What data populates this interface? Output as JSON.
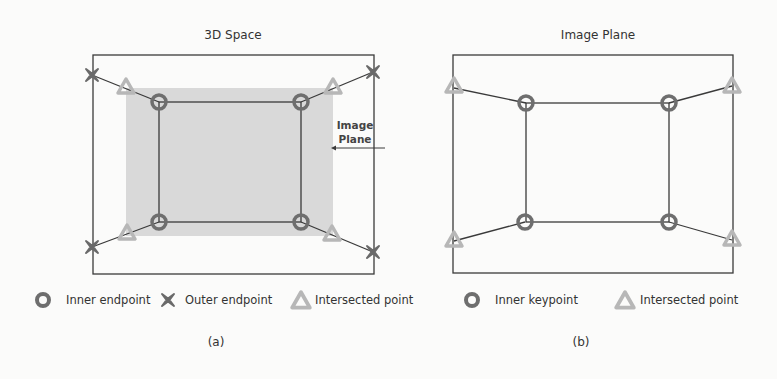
{
  "panel_a": {
    "title": "3D Space",
    "caption": "(a)",
    "annotation": {
      "line1": "Image",
      "line2": "Plane"
    },
    "legend": [
      {
        "marker": "circle",
        "label": "Inner endpoint"
      },
      {
        "marker": "x-cross",
        "label": "Outer endpoint"
      },
      {
        "marker": "triangle",
        "label": "Intersected point"
      }
    ]
  },
  "panel_b": {
    "title": "Image Plane",
    "caption": "(b)",
    "legend": [
      {
        "marker": "circle",
        "label": "Inner keypoint"
      },
      {
        "marker": "triangle",
        "label": "Intersected point"
      }
    ]
  },
  "colors": {
    "frame": "#3a3a3a",
    "image_plane_fill": "#d9d9d9",
    "inner_circle": "#6e6e6e",
    "outer_x": "#6a6a6a",
    "triangle": "#b7b7b7",
    "background": "#fbfbfa"
  }
}
